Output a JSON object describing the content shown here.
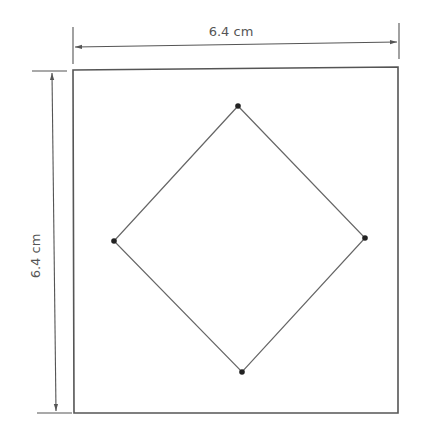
{
  "diagram": {
    "type": "geometry-figure",
    "colors": {
      "line": "#555555",
      "point": "#222222",
      "background": "#ffffff"
    },
    "outer_square": {
      "corners": [
        [
          73,
          70
        ],
        [
          398,
          67
        ],
        [
          398,
          413
        ],
        [
          74,
          413
        ]
      ]
    },
    "inner_diamond": {
      "vertices": [
        {
          "name": "top",
          "x": 238,
          "y": 106
        },
        {
          "name": "right",
          "x": 365,
          "y": 238
        },
        {
          "name": "bottom",
          "x": 242,
          "y": 372
        },
        {
          "name": "left",
          "x": 114,
          "y": 241
        }
      ]
    },
    "dimensions": {
      "width": {
        "label": "6.4 cm",
        "orientation": "horizontal"
      },
      "height": {
        "label": "6.4 cm",
        "orientation": "vertical"
      }
    }
  }
}
